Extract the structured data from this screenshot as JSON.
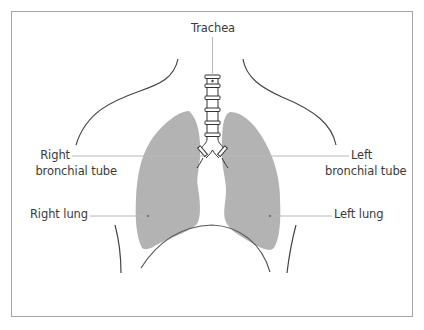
{
  "diagram": {
    "labels": {
      "trachea": "Trachea",
      "right_bronchial_line1": "Right",
      "right_bronchial_line2": "bronchial tube",
      "left_bronchial_line1": "Left",
      "left_bronchial_line2": "bronchial tube",
      "right_lung": "Right lung",
      "left_lung": "Left lung"
    },
    "colors": {
      "lung_fill": "#b3b3b3",
      "outline": "#444444",
      "leader_line": "#b8b8b8",
      "frame_border": "#a6a6a6",
      "text": "#3a3a3a"
    }
  }
}
